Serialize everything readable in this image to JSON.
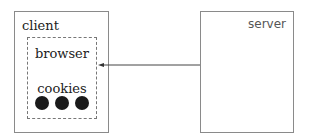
{
  "diagram": {
    "nodes": {
      "client": {
        "label": "client"
      },
      "server": {
        "label": "server"
      },
      "browser": {
        "label": "browser",
        "parent": "client",
        "style": "dashed"
      },
      "cookies": {
        "label": "cookies",
        "parent": "browser",
        "count": 3
      }
    },
    "edges": [
      {
        "from": "server",
        "to": "browser",
        "style": "solid-arrow"
      }
    ],
    "colors": {
      "border": "#8a8a8a",
      "dashed_border": "#777777",
      "cookie_fill": "#1a1a1a",
      "arrow": "#444444"
    }
  }
}
